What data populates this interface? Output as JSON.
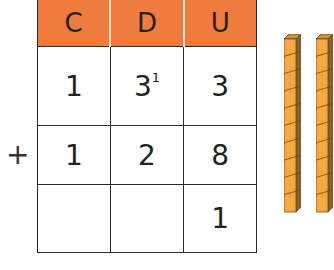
{
  "headers": [
    "C",
    "D",
    "U"
  ],
  "rows": [
    {
      "cells": [
        "1",
        "3",
        "3"
      ],
      "carry": [
        "",
        "1",
        ""
      ]
    },
    {
      "operator": "+",
      "cells": [
        "1",
        "2",
        "8"
      ]
    },
    {
      "cells": [
        "",
        "",
        "1"
      ]
    }
  ],
  "blocks": {
    "count": 2,
    "units_per_bar": 10,
    "color": "#f5a841",
    "header_color": "#f07b3d"
  }
}
